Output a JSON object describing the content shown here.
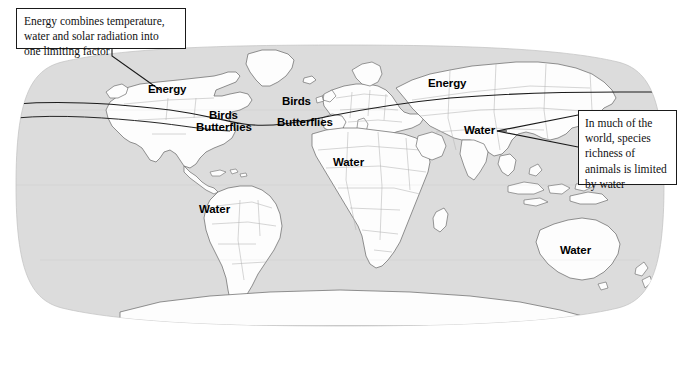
{
  "figure": {
    "type": "annotated-world-map",
    "projection": "robinson-oval",
    "colors": {
      "ocean": "#dcdcdc",
      "land": "#fdfdfd",
      "coastline": "#6d6d6d",
      "border": "#b4b4b4",
      "boundary_line": "#1a1a1a",
      "text": "#000000",
      "page": "#ffffff"
    }
  },
  "callouts": [
    {
      "id": "energy-callout",
      "text": "Energy combines temperature, water and solar radiation into one limiting factor",
      "points_to": "Energy"
    },
    {
      "id": "water-callout",
      "text": "In much of the world, species richness of animals is limited by water",
      "points_to": "Water"
    }
  ],
  "map_labels": [
    {
      "id": "energy-north-america",
      "text": "Energy",
      "region": "north-america-north"
    },
    {
      "id": "birds-north-america",
      "text": "Birds",
      "region": "north-america"
    },
    {
      "id": "butterflies-north-america",
      "text": "Butterflies",
      "region": "north-america"
    },
    {
      "id": "birds-europe",
      "text": "Birds",
      "region": "europe"
    },
    {
      "id": "butterflies-europe",
      "text": "Butterflies",
      "region": "europe"
    },
    {
      "id": "energy-eurasia",
      "text": "Energy",
      "region": "northern-eurasia"
    },
    {
      "id": "water-asia",
      "text": "Water",
      "region": "southern-asia"
    },
    {
      "id": "water-africa",
      "text": "Water",
      "region": "africa"
    },
    {
      "id": "water-south-america",
      "text": "Water",
      "region": "south-america"
    },
    {
      "id": "water-australia",
      "text": "Water",
      "region": "australia"
    }
  ],
  "legend_concepts": {
    "energy_regions": "Energy",
    "water_regions": "Water",
    "taxa": [
      "Birds",
      "Butterflies"
    ]
  }
}
